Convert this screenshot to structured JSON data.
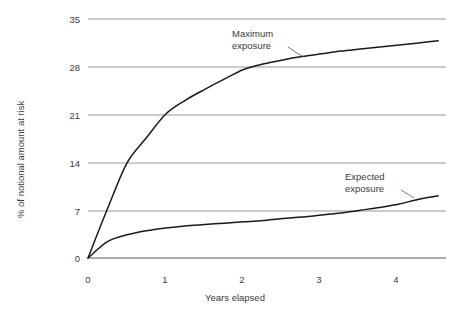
{
  "chart_data": {
    "type": "line",
    "title": "",
    "xlabel": "Years elapsed",
    "ylabel": "% of notional amount at risk",
    "xlim": [
      0,
      4.6
    ],
    "ylim": [
      0,
      35
    ],
    "grid": true,
    "legend_position": "inline-annotations",
    "xticks": [
      "0",
      "1",
      "2",
      "3",
      "4"
    ],
    "xtick_values": [
      0,
      1,
      2,
      3,
      4
    ],
    "yticks": [
      "0",
      "7",
      "14",
      "21",
      "28",
      "35"
    ],
    "ytick_values": [
      0,
      7,
      14,
      21,
      28,
      35
    ],
    "x": [
      0,
      0.25,
      0.5,
      0.75,
      1,
      1.25,
      1.5,
      1.75,
      2,
      2.25,
      2.5,
      2.75,
      3,
      3.25,
      3.5,
      3.75,
      4,
      4.25,
      4.5
    ],
    "series": [
      {
        "name": "Maximum exposure",
        "annotation": "Maximum\nexposure",
        "values": [
          0,
          7.2,
          13.9,
          17.6,
          21.1,
          23.1,
          24.7,
          26.2,
          27.6,
          28.4,
          29.0,
          29.5,
          29.9,
          30.3,
          30.6,
          30.9,
          31.2,
          31.5,
          31.8
        ]
      },
      {
        "name": "Expected exposure",
        "annotation": "Expected\nexposure",
        "values": [
          0,
          2.4,
          3.4,
          4.0,
          4.4,
          4.7,
          4.9,
          5.1,
          5.3,
          5.5,
          5.8,
          6.0,
          6.3,
          6.6,
          7.0,
          7.4,
          7.9,
          8.6,
          9.1
        ]
      }
    ]
  },
  "annotations": {
    "maximum": {
      "line1": "Maximum",
      "line2": "exposure"
    },
    "expected": {
      "line1": "Expected",
      "line2": "exposure"
    }
  },
  "axes": {
    "y_title": "% of notional amount at risk",
    "x_title": "Years elapsed",
    "y_tick_labels": [
      "35",
      "28",
      "21",
      "14",
      "7",
      "0"
    ],
    "x_tick_labels": [
      "0",
      "1",
      "2",
      "3",
      "4"
    ]
  },
  "colors": {
    "series_stroke": "#1a1a1a",
    "gridline": "#8d8d8d",
    "text": "#3a3a3a",
    "background": "#ffffff"
  }
}
